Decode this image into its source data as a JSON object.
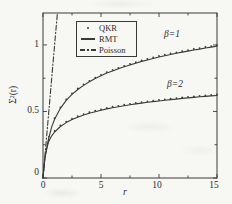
{
  "figure": {
    "background": "#f7f7f4",
    "ink": "#3a3a3a"
  },
  "chart_data": {
    "type": "line",
    "title": "",
    "xlabel": "r",
    "ylabel": "Σ²(r)",
    "xlim": [
      0,
      15
    ],
    "ylim": [
      0,
      1.24
    ],
    "grid": false,
    "legend_position": "upper-left-inside",
    "plot_px": {
      "left": 43,
      "right": 217,
      "top": 13,
      "bottom": 178
    },
    "xticks": {
      "major": [
        0,
        5,
        10,
        15
      ],
      "minor": [
        2.5,
        7.5,
        12.5
      ],
      "labels": [
        "0",
        "5",
        "10",
        "15"
      ]
    },
    "yticks": {
      "major": [
        0,
        0.5,
        1
      ],
      "minor": [
        0.25,
        0.75
      ],
      "labels": [
        "0",
        "0.5",
        "1"
      ]
    },
    "legend": {
      "items": [
        {
          "label": "QKR",
          "marker": "dot-marker"
        },
        {
          "label": "RMT",
          "marker": "solid-line"
        },
        {
          "label": "Poisson",
          "marker": "dash-dot-line"
        }
      ]
    },
    "annotations": [
      {
        "text": "β=1",
        "x": 11.5,
        "y": 1.07
      },
      {
        "text": "β=2",
        "x": 11.6,
        "y": 0.69
      }
    ],
    "series": [
      {
        "id": "rmt-beta1",
        "name": "RMT β=1",
        "style": "line",
        "r": [
          0,
          0.05,
          0.1,
          0.15,
          0.2,
          0.3,
          0.4,
          0.5,
          0.75,
          1,
          1.5,
          2,
          2.5,
          3,
          3.5,
          4,
          4.5,
          5,
          5.5,
          6,
          6.5,
          7,
          7.5,
          8,
          8.5,
          9,
          9.5,
          10,
          10.5,
          11,
          11.5,
          12,
          12.5,
          13,
          13.5,
          14,
          14.5,
          15
        ],
        "v": [
          0,
          0.05,
          0.095,
          0.135,
          0.165,
          0.215,
          0.262,
          0.302,
          0.384,
          0.442,
          0.524,
          0.583,
          0.628,
          0.665,
          0.696,
          0.723,
          0.747,
          0.768,
          0.788,
          0.805,
          0.821,
          0.836,
          0.85,
          0.863,
          0.876,
          0.887,
          0.898,
          0.909,
          0.919,
          0.928,
          0.937,
          0.946,
          0.954,
          0.962,
          0.969,
          0.977,
          0.984,
          0.991
        ]
      },
      {
        "id": "rmt-beta2",
        "name": "RMT β=2",
        "style": "line",
        "r": [
          0,
          0.05,
          0.1,
          0.15,
          0.2,
          0.3,
          0.4,
          0.5,
          0.75,
          1,
          1.5,
          2,
          2.5,
          3,
          3.5,
          4,
          4.5,
          5,
          5.5,
          6,
          6.5,
          7,
          7.5,
          8,
          8.5,
          9,
          9.5,
          10,
          10.5,
          11,
          11.5,
          12,
          12.5,
          13,
          13.5,
          14,
          14.5,
          15
        ],
        "v": [
          0,
          0.05,
          0.095,
          0.135,
          0.165,
          0.21,
          0.245,
          0.276,
          0.317,
          0.346,
          0.387,
          0.416,
          0.439,
          0.457,
          0.473,
          0.487,
          0.498,
          0.509,
          0.519,
          0.528,
          0.535,
          0.543,
          0.55,
          0.557,
          0.563,
          0.569,
          0.574,
          0.579,
          0.584,
          0.589,
          0.593,
          0.598,
          0.602,
          0.606,
          0.61,
          0.613,
          0.617,
          0.62
        ]
      },
      {
        "id": "poisson",
        "name": "Poisson",
        "style": "dashdot",
        "r": [
          0,
          1.24
        ],
        "v": [
          0,
          1.24
        ]
      },
      {
        "id": "qkr-beta1",
        "name": "QKR β=1",
        "style": "dots",
        "r": [
          0.5,
          1,
          1.5,
          2,
          2.5,
          3,
          3.5,
          4,
          4.5,
          5,
          5.5,
          6,
          6.5,
          7,
          7.5,
          8,
          8.5,
          9,
          9.5,
          10,
          10.5,
          11,
          11.5,
          12,
          12.5,
          13,
          13.5,
          14,
          14.5,
          15
        ],
        "v": [
          0.302,
          0.442,
          0.524,
          0.583,
          0.628,
          0.665,
          0.696,
          0.723,
          0.747,
          0.768,
          0.788,
          0.805,
          0.821,
          0.836,
          0.85,
          0.863,
          0.876,
          0.887,
          0.898,
          0.909,
          0.919,
          0.928,
          0.937,
          0.946,
          0.954,
          0.962,
          0.969,
          0.977,
          0.984,
          0.991
        ]
      },
      {
        "id": "qkr-beta2",
        "name": "QKR β=2",
        "style": "dots",
        "r": [
          0.5,
          1,
          1.5,
          2,
          2.5,
          3,
          3.5,
          4,
          4.5,
          5,
          5.5,
          6,
          6.5,
          7,
          7.5,
          8,
          8.5,
          9,
          9.5,
          10,
          10.5,
          11,
          11.5,
          12,
          12.5,
          13,
          13.5,
          14,
          14.5,
          15
        ],
        "v": [
          0.276,
          0.346,
          0.387,
          0.416,
          0.439,
          0.457,
          0.473,
          0.487,
          0.498,
          0.509,
          0.519,
          0.528,
          0.535,
          0.543,
          0.55,
          0.557,
          0.563,
          0.569,
          0.574,
          0.579,
          0.584,
          0.589,
          0.593,
          0.598,
          0.602,
          0.606,
          0.61,
          0.613,
          0.617,
          0.62
        ]
      }
    ]
  }
}
